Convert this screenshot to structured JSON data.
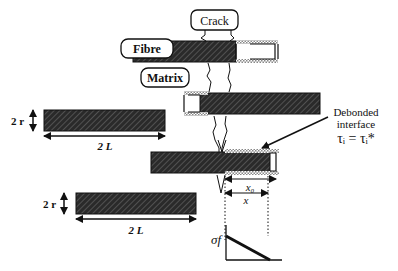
{
  "labels": {
    "crack": "Crack",
    "fibre": "Fibre",
    "matrix": "Matrix",
    "radius_top": "2 r",
    "length_top": "2 L",
    "radius_bottom": "2 r",
    "length_bottom": "2 L",
    "debonded_line1": "Debonded",
    "debonded_line2": "interface",
    "tau_eq": "τᵢ = τᵢ*",
    "x0": "x₀",
    "x": "x",
    "sigma_f": "σf"
  },
  "colors": {
    "ink": "#111111",
    "hatch_bg": "#2a2a2a",
    "debond_hatch": "#888888",
    "background": "#ffffff"
  }
}
